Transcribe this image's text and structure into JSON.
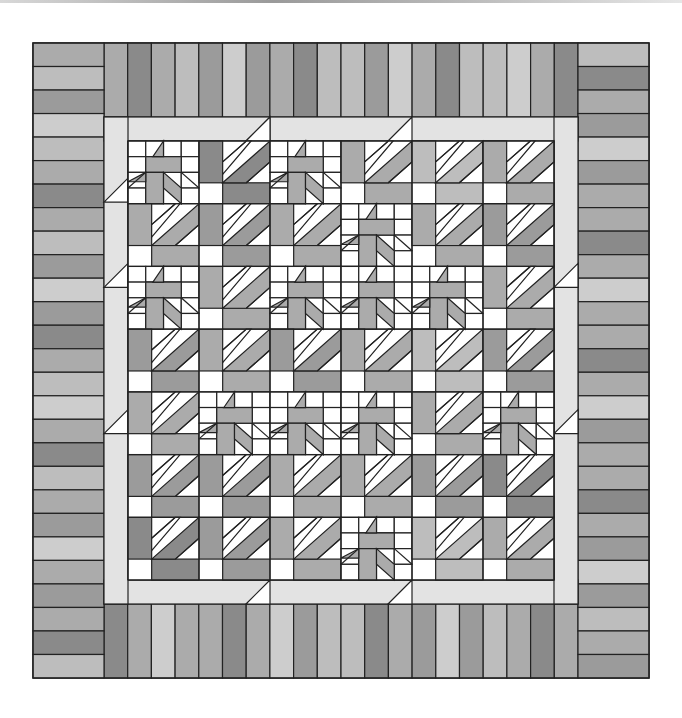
{
  "image": {
    "subject": "quilt-pattern",
    "width": 682,
    "height": 718
  },
  "colors": {
    "white": "#ffffff",
    "sash": "#e3e3e3",
    "g1": "#cdcdcd",
    "g2": "#bdbdbd",
    "g3": "#ababab",
    "g4": "#9b9b9b",
    "g5": "#8a8a8a",
    "g6": "#7a7a7a",
    "outline": "#222222"
  },
  "quilt": {
    "x0": 33,
    "y0": 43,
    "x1": 649,
    "y1": 678,
    "border_width": 71,
    "sash": 24,
    "top_strips": [
      "g3",
      "g5",
      "g3",
      "g2",
      "g4",
      "g1",
      "g4",
      "g3",
      "g5",
      "g2",
      "g2",
      "g4",
      "g1",
      "g3",
      "g5",
      "g2",
      "g2",
      "g1",
      "g3",
      "g5"
    ],
    "bottom_strips": [
      "g5",
      "g3",
      "g1",
      "g3",
      "g3",
      "g5",
      "g3",
      "g1",
      "g4",
      "g2",
      "g2",
      "g5",
      "g3",
      "g4",
      "g1",
      "g4",
      "g2",
      "g3",
      "g5",
      "g3"
    ],
    "left_strips": [
      "g3",
      "g2",
      "g4",
      "g1",
      "g2",
      "g3",
      "g5",
      "g3",
      "g2",
      "g4",
      "g1",
      "g4",
      "g5",
      "g3",
      "g2",
      "g1",
      "g3",
      "g5",
      "g2",
      "g3",
      "g4",
      "g1",
      "g3",
      "g4",
      "g3",
      "g5",
      "g2"
    ],
    "right_strips": [
      "g2",
      "g5",
      "g3",
      "g4",
      "g1",
      "g4",
      "g3",
      "g3",
      "g5",
      "g3",
      "g1",
      "g3",
      "g3",
      "g5",
      "g3",
      "g1",
      "g4",
      "g3",
      "g3",
      "g5",
      "g3",
      "g4",
      "g1",
      "g4",
      "g2",
      "g3",
      "g4"
    ],
    "corner_strips": {
      "top_left": [
        "g3",
        "g2",
        "g4"
      ],
      "top_right": [
        "g2",
        "g5",
        "g3"
      ],
      "bottom_left": [
        "g3",
        "g5",
        "g2"
      ],
      "bottom_right": [
        "g4",
        "g2",
        "g3"
      ]
    },
    "blocks": [
      {
        "row": 0,
        "col": 0,
        "a": {
          "type": "star",
          "tone": "g3"
        },
        "b": {
          "type": "pinwheel",
          "tone": "g5"
        },
        "c": {
          "type": "star",
          "tone": "g3"
        }
      },
      {
        "row": 0,
        "col": 1,
        "a": {
          "type": "pinwheel",
          "tone": "g3"
        },
        "b": {
          "type": "pinwheel",
          "tone": "g2"
        },
        "c": {
          "type": "pinwheel",
          "tone": "g3"
        }
      },
      {
        "row": 1,
        "col": 0,
        "a": {
          "type": "star",
          "tone": "g3"
        },
        "b": {
          "type": "pinwheel",
          "tone": "g4"
        },
        "c": {
          "type": "star",
          "tone": "g5"
        }
      },
      {
        "row": 1,
        "col": 1,
        "a": {
          "type": "pinwheel",
          "tone": "g3"
        },
        "b": {
          "type": "star",
          "tone": "g4"
        },
        "c": {
          "type": "star",
          "tone": "g4"
        }
      },
      {
        "row": 2,
        "col": 0,
        "a": {
          "type": "pinwheel",
          "tone": "g2"
        },
        "b": {
          "type": "star",
          "tone": "g3"
        },
        "c": {
          "type": "pinwheel",
          "tone": "g3"
        }
      },
      {
        "row": 2,
        "col": 1,
        "a": {
          "type": "pinwheel",
          "tone": "g3"
        },
        "b": {
          "type": "star",
          "tone": "g4"
        },
        "c": {
          "type": "pinwheel",
          "tone": "g2"
        }
      }
    ],
    "cells": [
      [
        "S",
        "P5",
        "S",
        "P3",
        "P2",
        "P3"
      ],
      [
        "P3",
        "P4",
        "P3",
        "S",
        "P3",
        "P4"
      ],
      [
        "S",
        "P3",
        "S",
        "S",
        "S",
        "P3"
      ],
      [
        "P4",
        "P3",
        "P4",
        "P3",
        "P2",
        "P4"
      ],
      [
        "P3",
        "S",
        "S",
        "S",
        "P3",
        "S"
      ],
      [
        "P4",
        "P4",
        "P3",
        "P3",
        "P4",
        "P5"
      ],
      [
        "P5",
        "P4",
        "P3",
        "S",
        "P2",
        "P3"
      ]
    ]
  }
}
